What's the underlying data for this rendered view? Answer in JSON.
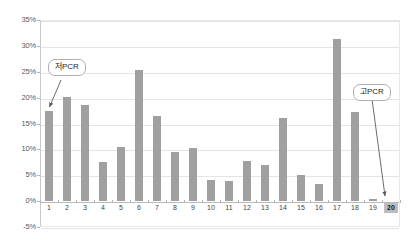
{
  "chart_data": {
    "type": "bar",
    "title": "",
    "subtitle": "",
    "xlabel": "",
    "ylabel": "",
    "categories": [
      "1",
      "2",
      "3",
      "4",
      "5",
      "6",
      "7",
      "8",
      "9",
      "10",
      "11",
      "12",
      "13",
      "14",
      "15",
      "16",
      "17",
      "18",
      "19",
      "20"
    ],
    "values": [
      17.5,
      20.2,
      18.6,
      7.6,
      10.4,
      25.3,
      16.5,
      9.4,
      10.2,
      4.0,
      3.9,
      7.7,
      7.0,
      16.0,
      5.1,
      3.3,
      31.3,
      17.2,
      0.5,
      0.0
    ],
    "series": [
      {
        "name": "PCR",
        "values": [
          17.5,
          20.2,
          18.6,
          7.6,
          10.4,
          25.3,
          16.5,
          9.4,
          10.2,
          4.0,
          3.9,
          7.7,
          7.0,
          16.0,
          5.1,
          3.3,
          31.3,
          17.2,
          0.5,
          0.0
        ]
      }
    ],
    "ylim": [
      -5,
      35
    ],
    "ytick_labels": [
      "35%",
      "30%",
      "25%",
      "20%",
      "15%",
      "10%",
      "5%",
      "0%",
      "-5%"
    ],
    "ytick_values": [
      35,
      30,
      25,
      20,
      15,
      10,
      5,
      0,
      -5
    ],
    "grid": true,
    "legend": "none",
    "bar_color": "#a0a0a0",
    "gridline_color": "#e4e4e4",
    "axis_color": "#c9c9c9",
    "annotations": [
      {
        "label": "저PCR",
        "target_category": "1",
        "position": "left"
      },
      {
        "label": "고PCR",
        "target_category": "20",
        "position": "right"
      }
    ],
    "highlighted_categories": [
      "20"
    ]
  }
}
